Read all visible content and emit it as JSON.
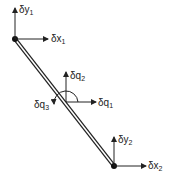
{
  "diagram": {
    "type": "beam-element-degrees-of-freedom",
    "nodes": [
      {
        "id": 1,
        "x_label": "δx",
        "x_sub": "1",
        "y_label": "δy",
        "y_sub": "1"
      },
      {
        "id": 2,
        "x_label": "δx",
        "x_sub": "2",
        "y_label": "δy",
        "y_sub": "2"
      }
    ],
    "midpoint": {
      "q1_label": "δq",
      "q1_sub": "1",
      "q2_label": "δq",
      "q2_sub": "2",
      "q3_label": "δq",
      "q3_sub": "3"
    },
    "colors": {
      "line": "#222222",
      "background": "#ffffff"
    }
  }
}
